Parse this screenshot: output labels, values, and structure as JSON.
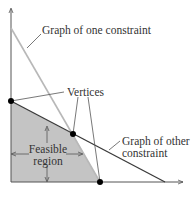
{
  "diagram": {
    "labels": {
      "constraint_one": "Graph of one constraint",
      "vertices": "Vertices",
      "feasible_line1": "Feasible",
      "feasible_line2": "region",
      "other_line1": "Graph of other",
      "other_line2": "constraint"
    },
    "colors": {
      "axis": "#555555",
      "constraint_one_line": "#b8b8b8",
      "constraint_other_line": "#3a3a3a",
      "feasible_fill": "#c4c4c4",
      "vertex": "#000000",
      "text": "#333333"
    },
    "vertices": [
      {
        "x": 11,
        "y": 101
      },
      {
        "x": 73,
        "y": 134
      },
      {
        "x": 100,
        "y": 182
      }
    ]
  }
}
